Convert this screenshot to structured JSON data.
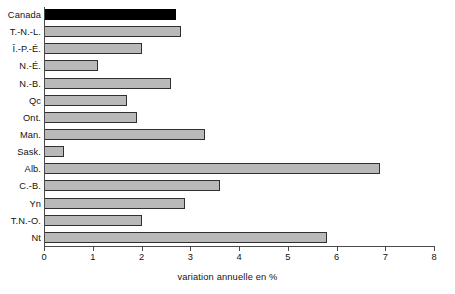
{
  "chart_data": {
    "type": "bar",
    "orientation": "horizontal",
    "title": "",
    "xlabel": "variation annuelle en %",
    "ylabel": "",
    "xlim": [
      0,
      8
    ],
    "xticks": [
      0,
      1,
      2,
      3,
      4,
      5,
      6,
      7,
      8
    ],
    "xticklabels": [
      "0",
      "1",
      "2",
      "3",
      "4",
      "5",
      "6",
      "7",
      "8"
    ],
    "grid": false,
    "legend": null,
    "categories": [
      "Canada",
      "T.-N.-L.",
      "Î.-P.-É.",
      "N.-É.",
      "N.-B.",
      "Qc",
      "Ont.",
      "Man.",
      "Sask.",
      "Alb.",
      "C.-B.",
      "Yn",
      "T.N.-O.",
      "Nt"
    ],
    "values": [
      2.7,
      2.8,
      2.0,
      1.1,
      2.6,
      1.7,
      1.9,
      3.3,
      0.4,
      6.9,
      3.6,
      2.9,
      2.0,
      5.8
    ],
    "highlight_category": "Canada",
    "colors": {
      "bar_fill": "#b9b9b9",
      "bar_edge": "#303030",
      "highlight_fill": "#000000",
      "axis": "#4a4a4a",
      "text": "#131313",
      "background": "#ffffff"
    }
  }
}
